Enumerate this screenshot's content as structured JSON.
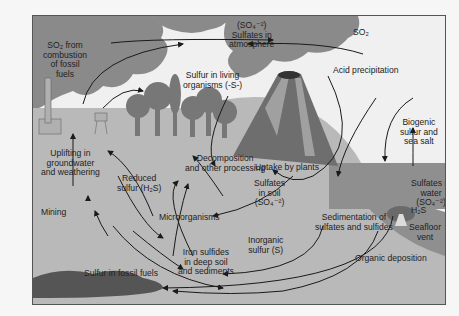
{
  "diagram": {
    "labels": {
      "so2_fossil": [
        "SO₂ from",
        "combustion",
        "of fossil",
        "fuels"
      ],
      "so4_atmo": [
        "(SO₄⁻²)",
        "Sulfates in",
        "atmosphere"
      ],
      "so2": "SO₂",
      "acid_precip": "Acid precipitation",
      "living": [
        "Sulfur in living",
        "organisms (-S-)"
      ],
      "biogenic": [
        "Biogenic",
        "sulfur and",
        "sea salt"
      ],
      "uplifting": [
        "Uplifting in",
        "groundwater",
        "and weathering"
      ],
      "decomposition": [
        "Decomposition",
        "and other processing"
      ],
      "uptake": "Uptake by plants",
      "reduced": [
        "Reduced",
        "sulfur (H₂S)"
      ],
      "sulfates_soil": [
        "Sulfates",
        "in soil",
        "(SO₄⁻²)"
      ],
      "sulfates_water": [
        "Sulfates in",
        "water",
        "(SO₄⁻²)"
      ],
      "h2s": "H₂S",
      "microorganisms": "Microorganisms",
      "mining": "Mining",
      "inorganic": [
        "Inorganic",
        "sulfur (S)"
      ],
      "sedimentation": [
        "Sedimentation of",
        "sulfates and sulfides"
      ],
      "seafloor": [
        "Seafloor",
        "vent"
      ],
      "iron_sulfides": [
        "Iron sulfides",
        "in deep soil",
        "and sediments"
      ],
      "organic_dep": "Organic deposition",
      "fossil_fuels": "Sulfur in fossil fuels"
    },
    "colors": {
      "cloud": "#8a8a8a",
      "soil": "#b9b9b9",
      "water": "#8f8f8f",
      "volcano": "#6e6e6e",
      "trees": "#777777",
      "fossil": "#555555",
      "arrow": "#1a1a1a"
    }
  }
}
